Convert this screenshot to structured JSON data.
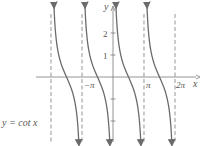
{
  "chart_data": {
    "type": "line",
    "title": "",
    "function_label": "y = cot x",
    "xlabel": "x",
    "ylabel": "y",
    "x_ticks": [
      {
        "value": -3.14159,
        "label": "−π"
      },
      {
        "value": 3.14159,
        "label": "π"
      },
      {
        "value": 6.28319,
        "label": "2π"
      }
    ],
    "y_ticks": [
      {
        "value": 2,
        "label": "2"
      },
      {
        "value": 1,
        "label": "1"
      },
      {
        "value": -1,
        "label": ""
      },
      {
        "value": -2,
        "label": ""
      }
    ],
    "asymptotes": [
      -6.28319,
      -3.14159,
      0,
      3.14159,
      6.28319
    ],
    "xlim": [
      -8.5,
      8.8
    ],
    "ylim": [
      -3.0,
      3.4
    ],
    "grid": false,
    "series": [
      {
        "name": "cot x, branch 1",
        "domain": [
          -6.28319,
          -3.14159
        ]
      },
      {
        "name": "cot x, branch 2",
        "domain": [
          -3.14159,
          0
        ]
      },
      {
        "name": "cot x, branch 3",
        "domain": [
          0,
          3.14159
        ]
      },
      {
        "name": "cot x, branch 4",
        "domain": [
          3.14159,
          6.28319
        ]
      }
    ],
    "colors": {
      "curve": "#6b6b6b",
      "axis": "#7a7a7a",
      "asymptote": "#8a8a8a"
    }
  },
  "labels": {
    "y_axis": "y",
    "x_axis": "x",
    "neg_pi": "−π",
    "pi": "π",
    "two_pi": "2π",
    "y2": "2",
    "y1": "1",
    "equation": "y = cot x"
  }
}
